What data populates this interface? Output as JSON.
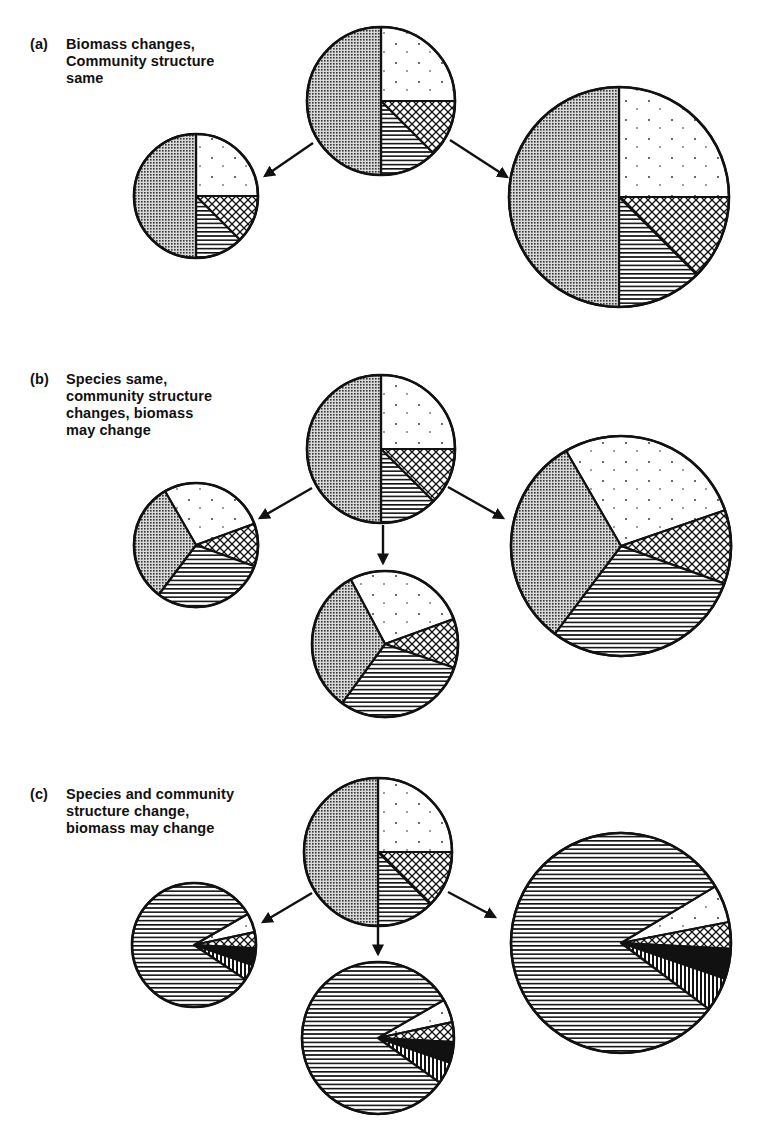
{
  "figure": {
    "panels": [
      {
        "id": "a",
        "tag": "(a)",
        "caption_lines": [
          "Biomass changes,",
          "Community structure",
          "same"
        ],
        "label_pos": [
          30,
          36
        ]
      },
      {
        "id": "b",
        "tag": "(b)",
        "caption_lines": [
          "Species same,",
          "community structure",
          "changes, biomass",
          "may change"
        ],
        "label_pos": [
          30,
          371
        ]
      },
      {
        "id": "c",
        "tag": "(c)",
        "caption_lines": [
          "Species and community",
          "structure change,",
          "biomass may change"
        ],
        "label_pos": [
          30,
          786
        ]
      }
    ],
    "legend_patterns": {
      "gray": "dense dot screen (species 1)",
      "dots": "sparse dots (species 2)",
      "crosshatch": "diamond crosshatch (species 3)",
      "hstripes": "horizontal stripes (species 4)",
      "black": "solid black (new species 5)",
      "vstripes": "vertical stripes (new species 6)"
    }
  },
  "chart_data": {
    "type": "pie",
    "note": "Circle area represents biomass; wedges represent species proportions. Angles in degrees, clockwise from 3 o'clock.",
    "pies": [
      {
        "panel": "a",
        "role": "original",
        "cx": 381,
        "cy": 101,
        "r": 74,
        "wedges": [
          {
            "pattern": "dots",
            "from": -90,
            "to": 0
          },
          {
            "pattern": "crosshatch",
            "from": 0,
            "to": 45
          },
          {
            "pattern": "hstripes",
            "from": 45,
            "to": 90
          },
          {
            "pattern": "gray",
            "from": 90,
            "to": 270
          }
        ]
      },
      {
        "panel": "a",
        "role": "smaller biomass",
        "cx": 196,
        "cy": 196,
        "r": 62,
        "wedges": [
          {
            "pattern": "dots",
            "from": -90,
            "to": 0
          },
          {
            "pattern": "crosshatch",
            "from": 0,
            "to": 45
          },
          {
            "pattern": "hstripes",
            "from": 45,
            "to": 90
          },
          {
            "pattern": "gray",
            "from": 90,
            "to": 270
          }
        ]
      },
      {
        "panel": "a",
        "role": "larger biomass",
        "cx": 619,
        "cy": 197,
        "r": 110,
        "wedges": [
          {
            "pattern": "dots",
            "from": -90,
            "to": 0
          },
          {
            "pattern": "crosshatch",
            "from": 0,
            "to": 45
          },
          {
            "pattern": "hstripes",
            "from": 45,
            "to": 90
          },
          {
            "pattern": "gray",
            "from": 90,
            "to": 270
          }
        ]
      },
      {
        "panel": "b",
        "role": "original",
        "cx": 381,
        "cy": 449,
        "r": 74,
        "wedges": [
          {
            "pattern": "dots",
            "from": -90,
            "to": 0
          },
          {
            "pattern": "crosshatch",
            "from": 0,
            "to": 45
          },
          {
            "pattern": "hstripes",
            "from": 45,
            "to": 90
          },
          {
            "pattern": "gray",
            "from": 90,
            "to": 270
          }
        ]
      },
      {
        "panel": "b",
        "role": "smaller, restructured",
        "cx": 196,
        "cy": 545,
        "r": 62,
        "wedges": [
          {
            "pattern": "dots",
            "from": -120,
            "to": -20
          },
          {
            "pattern": "crosshatch",
            "from": -20,
            "to": 20
          },
          {
            "pattern": "hstripes",
            "from": 20,
            "to": 127
          },
          {
            "pattern": "gray",
            "from": 127,
            "to": 240
          }
        ]
      },
      {
        "panel": "b",
        "role": "same size, restructured",
        "cx": 385,
        "cy": 644,
        "r": 73,
        "wedges": [
          {
            "pattern": "dots",
            "from": -118,
            "to": -20
          },
          {
            "pattern": "crosshatch",
            "from": -20,
            "to": 19
          },
          {
            "pattern": "hstripes",
            "from": 19,
            "to": 126
          },
          {
            "pattern": "gray",
            "from": 126,
            "to": 242
          }
        ]
      },
      {
        "panel": "b",
        "role": "larger, restructured",
        "cx": 621,
        "cy": 546,
        "r": 110,
        "wedges": [
          {
            "pattern": "dots",
            "from": -120,
            "to": -19
          },
          {
            "pattern": "crosshatch",
            "from": -19,
            "to": 20
          },
          {
            "pattern": "hstripes",
            "from": 20,
            "to": 127
          },
          {
            "pattern": "gray",
            "from": 127,
            "to": 240
          }
        ]
      },
      {
        "panel": "c",
        "role": "original",
        "cx": 378,
        "cy": 852,
        "r": 74,
        "wedges": [
          {
            "pattern": "dots",
            "from": -90,
            "to": 0
          },
          {
            "pattern": "crosshatch",
            "from": 0,
            "to": 45
          },
          {
            "pattern": "hstripes",
            "from": 45,
            "to": 90
          },
          {
            "pattern": "gray",
            "from": 90,
            "to": 270
          }
        ]
      },
      {
        "panel": "c",
        "role": "smaller, new species",
        "cx": 194,
        "cy": 945,
        "r": 62,
        "wedges": [
          {
            "pattern": "dots",
            "from": -30,
            "to": -12
          },
          {
            "pattern": "crosshatch",
            "from": -12,
            "to": 3
          },
          {
            "pattern": "black",
            "from": 3,
            "to": 19
          },
          {
            "pattern": "vstripes",
            "from": 19,
            "to": 34
          },
          {
            "pattern": "hstripes",
            "from": 34,
            "to": 330
          }
        ]
      },
      {
        "panel": "c",
        "role": "same size, new species",
        "cx": 378,
        "cy": 1038,
        "r": 76,
        "wedges": [
          {
            "pattern": "dots",
            "from": -30,
            "to": -12
          },
          {
            "pattern": "crosshatch",
            "from": -12,
            "to": 3
          },
          {
            "pattern": "black",
            "from": 3,
            "to": 19
          },
          {
            "pattern": "vstripes",
            "from": 19,
            "to": 36
          },
          {
            "pattern": "hstripes",
            "from": 36,
            "to": 330
          }
        ]
      },
      {
        "panel": "c",
        "role": "larger, new species",
        "cx": 621,
        "cy": 943,
        "r": 110,
        "wedges": [
          {
            "pattern": "dots",
            "from": -31,
            "to": -11
          },
          {
            "pattern": "crosshatch",
            "from": -11,
            "to": 3
          },
          {
            "pattern": "black",
            "from": 3,
            "to": 19
          },
          {
            "pattern": "vstripes",
            "from": 19,
            "to": 37
          },
          {
            "pattern": "hstripes",
            "from": 37,
            "to": 329
          }
        ]
      }
    ],
    "arrows": [
      {
        "panel": "a",
        "from": [
          313,
          143
        ],
        "to": [
          265,
          176
        ]
      },
      {
        "panel": "a",
        "from": [
          450,
          140
        ],
        "to": [
          507,
          177
        ]
      },
      {
        "panel": "b",
        "from": [
          312,
          488
        ],
        "to": [
          260,
          518
        ]
      },
      {
        "panel": "b",
        "from": [
          383,
          525
        ],
        "to": [
          383,
          563
        ]
      },
      {
        "panel": "b",
        "from": [
          448,
          487
        ],
        "to": [
          503,
          518
        ]
      },
      {
        "panel": "c",
        "from": [
          312,
          893
        ],
        "to": [
          263,
          922
        ]
      },
      {
        "panel": "c",
        "from": [
          378,
          927
        ],
        "to": [
          378,
          954
        ]
      },
      {
        "panel": "c",
        "from": [
          448,
          892
        ],
        "to": [
          495,
          917
        ]
      }
    ]
  }
}
